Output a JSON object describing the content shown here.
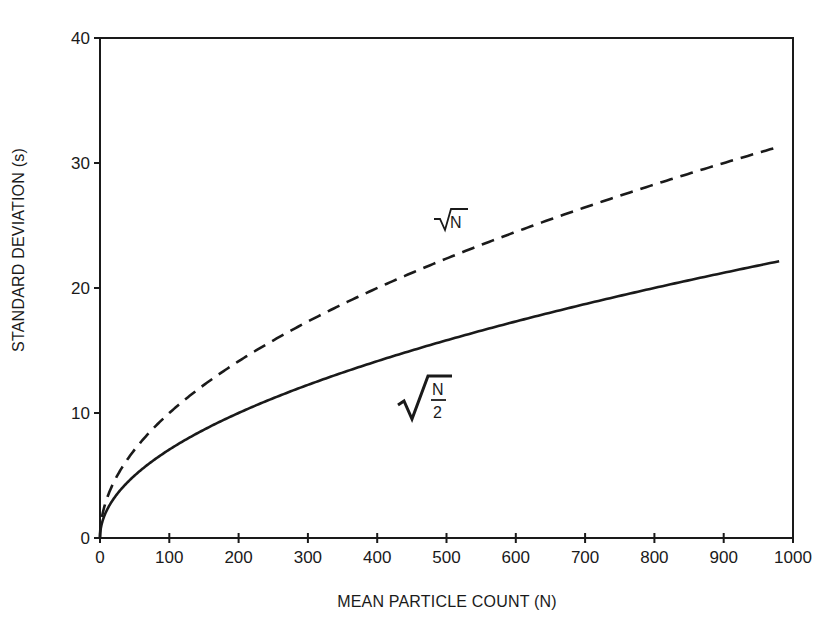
{
  "chart_data": {
    "type": "line",
    "title": "",
    "xlabel": "MEAN PARTICLE COUNT (N)",
    "ylabel": "STANDARD DEVIATION (s)",
    "xlim": [
      0,
      1000
    ],
    "ylim": [
      0,
      40
    ],
    "grid": false,
    "legend": "none (inline annotations)",
    "x_ticks": [
      0,
      100,
      200,
      300,
      400,
      500,
      600,
      700,
      800,
      900,
      1000
    ],
    "y_ticks": [
      0,
      10,
      20,
      30,
      40
    ],
    "x": [
      0,
      5,
      10,
      25,
      50,
      100,
      150,
      200,
      300,
      400,
      500,
      600,
      700,
      800,
      900,
      980
    ],
    "series": [
      {
        "name": "√N",
        "style": "dashed",
        "values": [
          0,
          2.24,
          3.16,
          5.0,
          7.07,
          10.0,
          12.25,
          14.14,
          17.32,
          20.0,
          22.36,
          24.49,
          26.46,
          28.28,
          30.0,
          31.3
        ]
      },
      {
        "name": "√(N/2)",
        "style": "solid",
        "values": [
          0,
          1.58,
          2.24,
          3.54,
          5.0,
          7.07,
          8.66,
          10.0,
          12.25,
          14.14,
          15.81,
          17.32,
          18.71,
          20.0,
          21.21,
          22.14
        ]
      }
    ],
    "annotations": [
      {
        "text": "√N",
        "series": "dashed",
        "x": 480,
        "y": 25.2
      },
      {
        "text": "√(N/2)",
        "series": "solid",
        "x": 460,
        "y": 10.5
      }
    ]
  },
  "labels": {
    "x_axis_title": "MEAN PARTICLE COUNT (N)",
    "y_axis_title": "STANDARD DEVIATION (s)",
    "annot_sqrt_n_radicand": "N",
    "annot_sqrt_half_num": "N",
    "annot_sqrt_half_den": "2"
  }
}
